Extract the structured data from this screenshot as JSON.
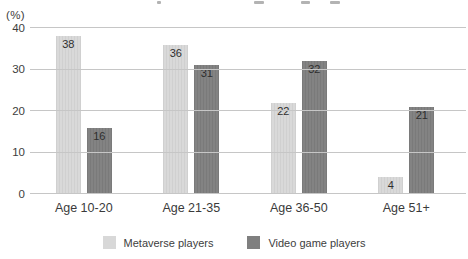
{
  "chart_data": {
    "type": "bar",
    "categories": [
      "Age 10-20",
      "Age 21-35",
      "Age 36-50",
      "Age 51+"
    ],
    "series": [
      {
        "name": "Metaverse players",
        "color": "#d8d8d8",
        "values": [
          38,
          36,
          22,
          4
        ]
      },
      {
        "name": "Video game players",
        "color": "#7f7f7f",
        "values": [
          16,
          31,
          32,
          21
        ]
      }
    ],
    "title": "",
    "xlabel": "",
    "ylabel": "(%)",
    "yticks": [
      0,
      10,
      20,
      30,
      40
    ],
    "ylim": [
      0,
      40
    ],
    "grid": true,
    "legend_position": "bottom",
    "value_labels": "inside-top",
    "colors": {
      "gridline": "#c6c6c6",
      "text": "#3d3d3d",
      "background": "#ffffff"
    }
  }
}
